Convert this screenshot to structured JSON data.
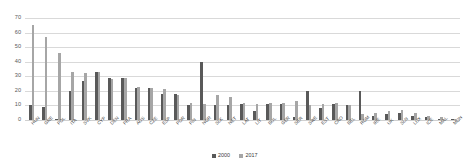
{
  "chart_data": {
    "type": "bar",
    "title": "",
    "xlabel": "",
    "ylabel": "",
    "ylim": [
      0,
      70
    ],
    "yticks": [
      0,
      10,
      20,
      30,
      40,
      50,
      60,
      70
    ],
    "grid": true,
    "legend_position": "bottom-center",
    "colors": {
      "2000": "#595959",
      "2017": "#a6a6a6"
    },
    "categories": [
      "HUN",
      "GRE",
      "POL",
      "ITA",
      "SVK",
      "CYP",
      "DEN",
      "FRA",
      "AUS",
      "CZE",
      "ESP",
      "POR",
      "FIN",
      "NOR",
      "SLK",
      "NET",
      "LAT",
      "LIT",
      "BUL",
      "GER",
      "SER",
      "SWE",
      "EST",
      "CRO",
      "BEL",
      "ROM",
      "IRE",
      "UK",
      "SLN",
      "LUX",
      "ICE",
      "MAL",
      "MON"
    ],
    "series": [
      {
        "name": "2000",
        "values": [
          10,
          9,
          1,
          20,
          27,
          33,
          29,
          29,
          22,
          22,
          18,
          18,
          10,
          40,
          10,
          10,
          11,
          6,
          11,
          11,
          2,
          20,
          8,
          11,
          10,
          20,
          3,
          4,
          5,
          3,
          2,
          1,
          1
        ]
      },
      {
        "name": "2017",
        "values": [
          65,
          57,
          46,
          33,
          32,
          33,
          28,
          29,
          23,
          22,
          21,
          17,
          12,
          11,
          17,
          16,
          12,
          11,
          12,
          12,
          13,
          10,
          11,
          12,
          10,
          4,
          5,
          6,
          7,
          5,
          3,
          2,
          1
        ]
      }
    ]
  },
  "legend": {
    "items": [
      {
        "label": "2000",
        "color": "#595959"
      },
      {
        "label": "2017",
        "color": "#a6a6a6"
      }
    ]
  }
}
